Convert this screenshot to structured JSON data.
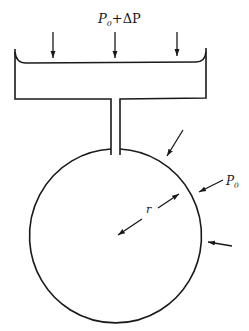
{
  "diagram": {
    "labels": {
      "reservoir_pressure": {
        "base": "P",
        "sub": "0",
        "rest": "+ΔP"
      },
      "radius": "r",
      "external_pressure": {
        "base": "P",
        "sub": "0"
      }
    },
    "colors": {
      "stroke": "#1a1a1a",
      "background": "#ffffff"
    }
  }
}
